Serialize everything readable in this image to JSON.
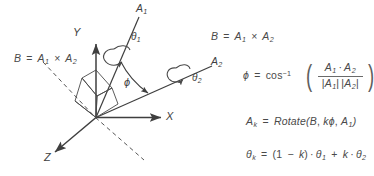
{
  "figure": {
    "kind": "vector-math-diagram",
    "background": "#ffffff",
    "ink": "#3f3f3f",
    "axes": {
      "x_label": "X",
      "y_label": "Y",
      "z_label": "Z"
    },
    "vectors": {
      "a1_label": "A",
      "a1_sub": "1",
      "a2_label": "A",
      "a2_sub": "2"
    },
    "angles": {
      "theta1_sym": "θ",
      "theta1_sub": "1",
      "theta2_sym": "θ",
      "theta2_sub": "2",
      "phi_sym": "ϕ"
    },
    "dashed_axis_label": {
      "lhs": "B",
      "eq": "=",
      "a1": "A",
      "a1_sub": "1",
      "cross": "×",
      "a2": "A",
      "a2_sub": "2"
    }
  },
  "equations": {
    "eq1": {
      "lhs": "B",
      "eq": "=",
      "a1": "A",
      "a1_sub": "1",
      "cross": "×",
      "a2": "A",
      "a2_sub": "2"
    },
    "eq2": {
      "lhs": "ϕ",
      "eq": "=",
      "fn": "cos",
      "exp": "−1",
      "open": "(",
      "close": ")",
      "num_a1": "A",
      "num_a1_sub": "1",
      "dot": "·",
      "num_a2": "A",
      "num_a2_sub": "2",
      "den_bar_l": "|",
      "den_a1": "A",
      "den_a1_sub": "1",
      "den_bar_m": "|",
      "den_bar_l2": "|",
      "den_a2": "A",
      "den_a2_sub": "2",
      "den_bar_r": "|"
    },
    "eq3": {
      "lhs": "A",
      "lhs_sub": "k",
      "eq": "=",
      "fn": "Rotate",
      "open": "(",
      "arg1": "B",
      "comma1": ",",
      "arg2_k": "k",
      "arg2_phi": "ϕ",
      "comma2": ",",
      "arg3": "A",
      "arg3_sub": "1",
      "close": ")"
    },
    "eq4": {
      "lhs": "θ",
      "lhs_sub": "k",
      "eq": "=",
      "open": "(",
      "one": "1",
      "minus": "−",
      "k1": "k",
      "close": ")",
      "dot1": "·",
      "th1": "θ",
      "th1_sub": "1",
      "plus": "+",
      "k2": "k",
      "dot2": "·",
      "th2": "θ",
      "th2_sub": "2"
    }
  }
}
